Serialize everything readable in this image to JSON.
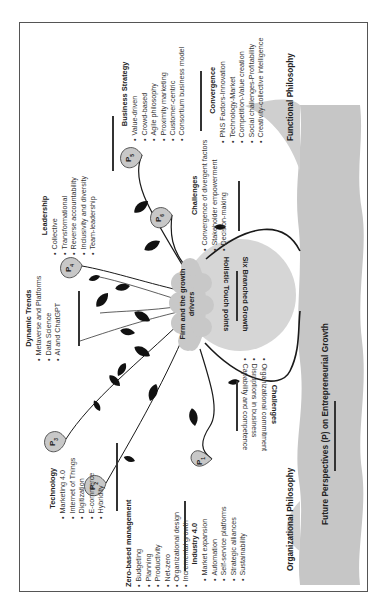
{
  "diagram": {
    "title": "Future Perspectives (P) on Entrepreneurial Growth",
    "center_node": "Firm and the growth drivers",
    "hub": {
      "line1": "Holistic Touch points",
      "line2": "Six Branched Growth"
    },
    "philosophies": {
      "left": "Organizational Philosophy",
      "right": "Functional Philosophy"
    },
    "perspectives": [
      {
        "id": "P1",
        "label": "P",
        "sub": "1"
      },
      {
        "id": "P2",
        "label": "P",
        "sub": "2"
      },
      {
        "id": "P3",
        "label": "P",
        "sub": "3"
      },
      {
        "id": "P4",
        "label": "P",
        "sub": "4"
      },
      {
        "id": "P5",
        "label": "P",
        "sub": "5"
      },
      {
        "id": "P6",
        "label": "P",
        "sub": "6"
      }
    ],
    "blocks": {
      "zero_based": {
        "title": "Zero-based management",
        "items": [
          "Budgeting",
          "Planning",
          "Productivity",
          "Net-zero",
          "Organizational design",
          "Incremental growth"
        ]
      },
      "industry": {
        "title": "Industry 4.0",
        "items": [
          "Market expansion",
          "Automation",
          "Self-service platforms",
          "Strategic alliances",
          "Sustainability"
        ]
      },
      "technology": {
        "title": "Technology",
        "items": [
          "Marketing 4.0",
          "Internet of Things",
          "Digitization",
          "E-commerce",
          "Hybridity"
        ]
      },
      "dynamic_trends": {
        "title": "Dynamic Trends",
        "items": [
          "Metaverse and Platforms",
          "Data Science",
          "AI and ChatGPT"
        ]
      },
      "leadership": {
        "title": "Leadership",
        "items": [
          "Collective",
          "Transformational",
          "Reverse accountability",
          "Inclusivity and diversity",
          "Team-leadership"
        ]
      },
      "business_strategy": {
        "title": "Business Strategy",
        "items": [
          "Value-driven",
          "Crowd-based",
          "Agile philosophy",
          "Proximity marketing",
          "Customer-centric",
          "Consortium business model"
        ]
      },
      "convergence": {
        "title": "Convergence",
        "items": [
          "PNS Factors-Innovation",
          "Technology-Market",
          "Competition-Value creation",
          "Social challenges-Profitability",
          "Creativity-collective intelligence"
        ]
      },
      "challenges_upper": {
        "title": "Challenges",
        "items": [
          "Convergence of divergent factors",
          "Stakeholder empowerment",
          "Decision-making"
        ]
      },
      "challenges_lower": {
        "title": "Challenges",
        "items": [
          "Organizational commitment",
          "Disruptions in business",
          "Capability and competence"
        ]
      }
    },
    "colors": {
      "node_fill": "#c8c8c8",
      "hub_fill": "#d4d4d4",
      "foundation_fill": "#c4c4c4",
      "line": "#1a1a1a",
      "leaf": "#111111",
      "frame": "#555555"
    }
  }
}
